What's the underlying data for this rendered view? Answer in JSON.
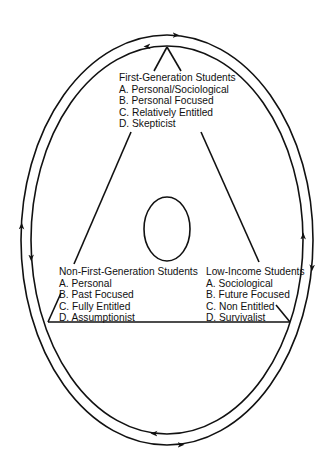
{
  "diagram": {
    "colors": {
      "stroke": "#111111",
      "background": "#ffffff"
    },
    "groups": [
      {
        "title": "First-Generation Students",
        "items": [
          "A. Personal/Sociological",
          "B. Personal Focused",
          "C. Relatively Entitled",
          "D. Skepticist"
        ]
      },
      {
        "title": "Non-First-Generation Students",
        "items": [
          "A. Personal",
          "B. Past Focused",
          "C. Fully Entitled",
          "D. Assumptionist"
        ]
      },
      {
        "title": "Low-Income Students",
        "items": [
          "A. Sociological",
          "B. Future Focused",
          "C. Non Entitled",
          "D. Survivalist"
        ]
      }
    ],
    "shapes": {
      "outer_cycle": "double ellipse with bidirectional arrows",
      "center": "small ellipse",
      "frame": "triangle connecting the three student groups"
    }
  }
}
